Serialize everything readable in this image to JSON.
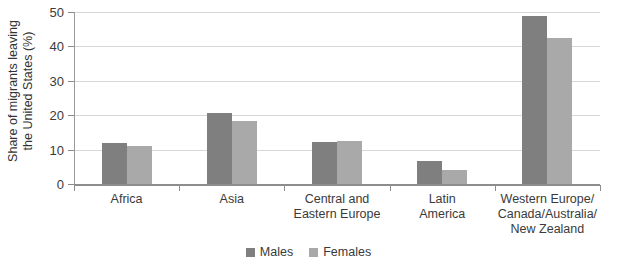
{
  "chart_data": {
    "type": "bar",
    "title": "",
    "xlabel": "",
    "ylabel": "Share of migrants leaving\nthe United States (%)",
    "ylim": [
      0,
      50
    ],
    "ytick_labels": [
      "0",
      "10",
      "20",
      "30",
      "40",
      "50"
    ],
    "ytick_values": [
      0,
      10,
      20,
      30,
      40,
      50
    ],
    "grid": true,
    "legend_position": "bottom-center",
    "categories": [
      "Africa",
      "Asia",
      "Central and\nEastern Europe",
      "Latin\nAmerica",
      "Western Europe/\nCanada/Australia/\nNew Zealand"
    ],
    "series": [
      {
        "name": "Males",
        "color": "#7f7f7f",
        "values": [
          11.9,
          20.6,
          12.3,
          6.6,
          48.8
        ]
      },
      {
        "name": "Females",
        "color": "#a9a9a9",
        "values": [
          11.0,
          18.3,
          12.4,
          4.0,
          42.5
        ]
      }
    ]
  },
  "legend": {
    "items": [
      {
        "label": "Males",
        "color": "#7f7f7f",
        "swatch_name": "legend-swatch-males"
      },
      {
        "label": "Females",
        "color": "#a9a9a9",
        "swatch_name": "legend-swatch-females"
      }
    ]
  },
  "colors": {
    "males": "#7f7f7f",
    "females": "#a9a9a9",
    "gridline": "#d8d8d8",
    "axis": "#8d8d8d",
    "text": "#3a3a3a",
    "background": "#ffffff"
  }
}
